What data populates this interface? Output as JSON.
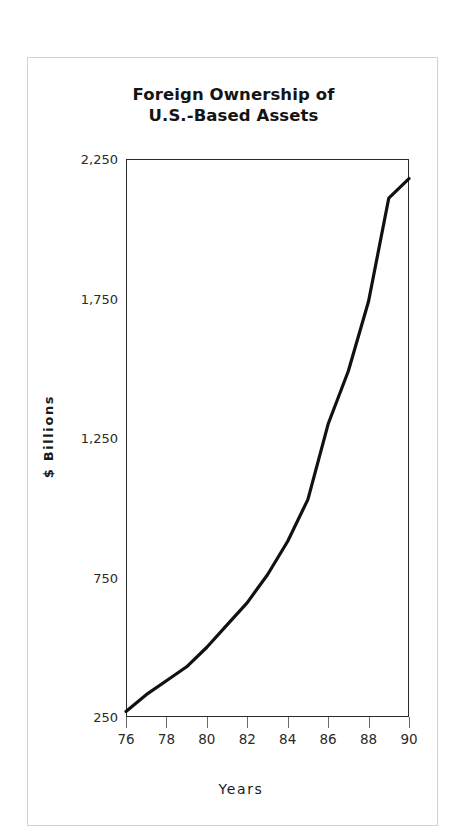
{
  "chart_data": {
    "type": "line",
    "title": "Foreign Ownership of U.S.-Based Assets",
    "title_lines": [
      "Foreign Ownership of",
      "U.S.-Based Assets"
    ],
    "xlabel": "Years",
    "ylabel": "$ Billions",
    "ylim": [
      250,
      2250
    ],
    "xlim": [
      76,
      90
    ],
    "yticks": [
      2250,
      1750,
      1250,
      750,
      250
    ],
    "ytick_labels": [
      "2,250",
      "1,750",
      "1,250",
      "750",
      "250"
    ],
    "xticks": [
      76,
      78,
      80,
      82,
      84,
      86,
      88,
      90
    ],
    "xtick_labels": [
      "76",
      "78",
      "80",
      "82",
      "84",
      "86",
      "88",
      "90"
    ],
    "grid": "horizontal",
    "legend": "none",
    "line_color": "#111111",
    "line_width": 3.2,
    "x": [
      76,
      77,
      78,
      79,
      80,
      81,
      82,
      83,
      84,
      85,
      86,
      87,
      88,
      89,
      90
    ],
    "values": [
      270,
      330,
      380,
      430,
      500,
      580,
      660,
      760,
      880,
      1030,
      1300,
      1490,
      1740,
      2110,
      2180
    ],
    "series": [
      {
        "name": "Foreign Ownership of U.S.-Based Assets",
        "values": [
          270,
          330,
          380,
          430,
          500,
          580,
          660,
          760,
          880,
          1030,
          1300,
          1490,
          1740,
          2110,
          2180
        ]
      }
    ]
  },
  "figure": {
    "frame_color": "#d2d2d2",
    "background": "#ffffff",
    "axis_color": "#2b2b2b",
    "grid_color": "#e4e4e4"
  }
}
